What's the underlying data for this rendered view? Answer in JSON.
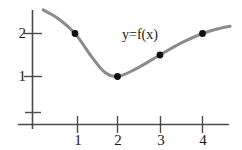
{
  "chart_data": {
    "type": "line",
    "title": "",
    "subtitle": "",
    "xlabel": "",
    "ylabel": "",
    "annotations": [
      {
        "text": "y=f(x)",
        "x": 2.15,
        "y": 2.0,
        "name": "curve-label"
      }
    ],
    "grid": false,
    "legend": null,
    "axis": {
      "x_tick_labels": [
        "1",
        "2",
        "3",
        "4"
      ],
      "x_ticks": [
        1,
        2,
        3,
        4
      ],
      "y_tick_labels": [
        "1",
        "2"
      ],
      "y_ticks": [
        1,
        2
      ],
      "xlim": [
        -0.35,
        4.65
      ],
      "ylim": [
        -0.35,
        2.55
      ],
      "x_axis_color": "#4a4a4a",
      "y_axis_color": "#4a4a4a"
    },
    "series": [
      {
        "name": "f",
        "color": "#8c8c8c",
        "marker_color": "#111111",
        "marked_points": [
          {
            "x": 1,
            "y": 2.0
          },
          {
            "x": 2,
            "y": 1.0
          },
          {
            "x": 3,
            "y": 1.5
          },
          {
            "x": 4,
            "y": 2.0
          }
        ],
        "x": [
          0.25,
          0.6,
          1.0,
          1.4,
          1.7,
          2.0,
          2.4,
          3.0,
          3.5,
          4.0,
          4.4,
          4.65
        ],
        "values": [
          2.55,
          2.35,
          2.0,
          1.45,
          1.1,
          1.0,
          1.16,
          1.5,
          1.78,
          2.0,
          2.12,
          2.17
        ]
      }
    ]
  },
  "labels": {
    "x1": "1",
    "x2": "2",
    "x3": "3",
    "x4": "4",
    "y1": "1",
    "y2": "2",
    "curve": "y=f(x)"
  }
}
